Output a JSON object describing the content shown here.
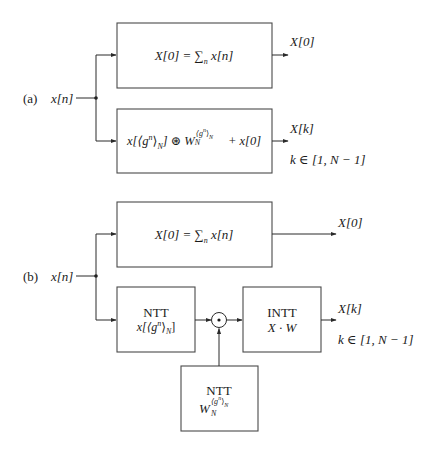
{
  "panels": [
    {
      "id": "a",
      "label": "(a)",
      "input": "x[n]",
      "top_block": {
        "formula": "X[0] = ∑",
        "formula_sub": "n",
        "formula_tail": " x[n]",
        "output": "X[0]"
      },
      "bottom_block": {
        "formula_head": "x[⟨g",
        "formula_sup1": "n",
        "formula_mid": "⟩",
        "formula_sub1": "N",
        "formula_op": "] ⊛ W",
        "formula_sub2": "N",
        "formula_sup2": "⟨g",
        "formula_sup2b": "n",
        "formula_sup2c": "⟩",
        "formula_sup2d": "N",
        "formula_tail": " + x[0]",
        "output": "X[k]",
        "range": "k ∈ [1, N − 1]"
      }
    },
    {
      "id": "b",
      "label": "(b)",
      "input": "x[n]",
      "top_block": {
        "formula": "X[0] = ∑",
        "formula_sub": "n",
        "formula_tail": " x[n]",
        "output": "X[0]"
      },
      "ntt_input_block": {
        "title": "NTT",
        "expr_head": "x[⟨g",
        "expr_sup": "n",
        "expr_mid": "⟩",
        "expr_sub": "N",
        "expr_tail": "]"
      },
      "multiplier": {
        "symbol": "⊙",
        "name": "pointwise-multiply"
      },
      "intt_block": {
        "title": "INTT",
        "expr": "X · W",
        "output": "X[k]",
        "range": "k ∈ [1, N − 1]"
      },
      "ntt_twiddle_block": {
        "title": "NTT",
        "expr_base": "W",
        "expr_sub": "N",
        "expr_sup": "⟨g",
        "expr_supn": "n",
        "expr_supc": "⟩",
        "expr_supN": "N"
      }
    }
  ],
  "colors": {
    "line": "#2a2a2a",
    "box_stroke": "#4a4a4a",
    "text": "#1a1a1a",
    "background": "#ffffff"
  }
}
